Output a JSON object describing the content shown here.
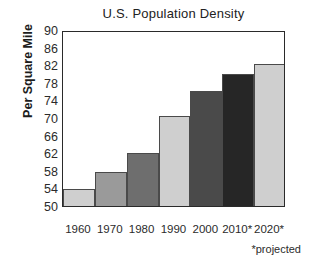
{
  "chart_data": {
    "type": "bar",
    "title": "U.S. Population Density",
    "xlabel": "",
    "ylabel": "Per Square Mile",
    "categories": [
      "1960",
      "1970",
      "1980",
      "1990",
      "2000",
      "2010*",
      "2020*"
    ],
    "values": [
      53.8,
      57.7,
      62.0,
      70.5,
      76.2,
      80.0,
      82.3
    ],
    "ylim": [
      50,
      90
    ],
    "yticks": [
      50,
      54,
      58,
      62,
      66,
      70,
      74,
      78,
      82,
      86,
      90
    ],
    "ytick_labels": [
      "50",
      "54",
      "58",
      "62",
      "66",
      "70",
      "74",
      "78",
      "82",
      "86",
      "90"
    ],
    "grid": false,
    "legend": null,
    "annotations": [
      "*projected"
    ],
    "bar_colors": [
      "#cfcfcf",
      "#9a9a9a",
      "#6e6e6e",
      "#cfcfcf",
      "#4a4a4a",
      "#262626",
      "#cfcfcf"
    ],
    "frame_color": "#2a2a2a"
  },
  "footnote": "*projected"
}
